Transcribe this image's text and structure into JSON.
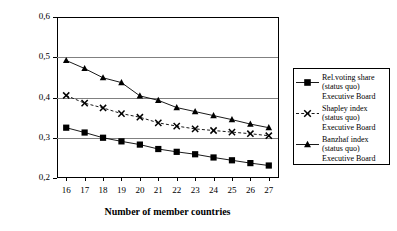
{
  "chart_data": {
    "type": "line",
    "title": "",
    "xlabel": "Number of member countries",
    "ylabel": "Voting share/power index",
    "x": [
      16,
      17,
      18,
      19,
      20,
      21,
      22,
      23,
      24,
      25,
      26,
      27
    ],
    "xticklabels": [
      "16",
      "17",
      "18",
      "19",
      "20",
      "21",
      "22",
      "23",
      "24",
      "25",
      "26",
      "27"
    ],
    "yticklabels": [
      "0,2",
      "0,3",
      "0,4",
      "0,5",
      "0,6"
    ],
    "ytickvalues": [
      0.2,
      0.3,
      0.4,
      0.5,
      0.6
    ],
    "xlim": [
      15.5,
      27.5
    ],
    "ylim": [
      0.2,
      0.6
    ],
    "grid": "horizontal",
    "legend_position": "right-outside",
    "series": [
      {
        "name": "Rel.voting share (status quo) Executive Board",
        "name_lines": [
          "Rel.voting share",
          "(status quo)",
          "Executive Board"
        ],
        "marker": "square",
        "linestyle": "solid",
        "color": "#000000",
        "values": [
          0.325,
          0.313,
          0.3,
          0.291,
          0.283,
          0.272,
          0.265,
          0.259,
          0.251,
          0.244,
          0.237,
          0.231
        ]
      },
      {
        "name": "Shapley index (status quo) Executive Board",
        "name_lines": [
          "Shapley index",
          "(status quo)",
          "Executive Board"
        ],
        "marker": "x",
        "linestyle": "dashed",
        "color": "#000000",
        "values": [
          0.405,
          0.386,
          0.374,
          0.36,
          0.351,
          0.337,
          0.329,
          0.322,
          0.318,
          0.314,
          0.31,
          0.305
        ]
      },
      {
        "name": "Banzhaf index (status quo) Executive Board",
        "name_lines": [
          "Banzhaf index",
          "(status quo)",
          "Executive Board"
        ],
        "marker": "triangle",
        "linestyle": "solid",
        "color": "#000000",
        "values": [
          0.492,
          0.472,
          0.449,
          0.437,
          0.404,
          0.393,
          0.375,
          0.365,
          0.355,
          0.345,
          0.334,
          0.325
        ]
      }
    ]
  }
}
